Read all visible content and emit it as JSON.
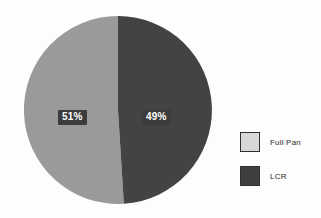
{
  "chart_data": {
    "type": "pie",
    "title": "",
    "categories": [
      "Full Pan",
      "LCR"
    ],
    "values": [
      51,
      49
    ],
    "value_unit": "%",
    "data_labels": [
      "51%",
      "49%"
    ],
    "colors": [
      "#9a9a9a",
      "#434343"
    ],
    "legend_position": "right",
    "legend": [
      {
        "label": "Full Pan",
        "value": 51,
        "display": "51%",
        "swatch_fill": "#d8d8d8",
        "swatch_border": "#2f2f2f",
        "slice_fill": "#9a9a9a"
      },
      {
        "label": "LCR",
        "value": 49,
        "display": "49%",
        "swatch_fill": "#3f3f3f",
        "swatch_border": "#2f2f2f",
        "slice_fill": "#434343"
      }
    ],
    "start_angle_deg": 0,
    "direction": "clockwise",
    "grid": false,
    "xlabel": "",
    "ylabel": ""
  },
  "labels": {
    "full_pan_pct": "51%",
    "lcr_pct": "49%"
  },
  "legend": {
    "full_pan_label": "Full Pan",
    "lcr_label": "LCR"
  },
  "background": {
    "bleed_text_right": "",
    "bleed_text_top": "",
    "bleed_text_bottom": ""
  }
}
